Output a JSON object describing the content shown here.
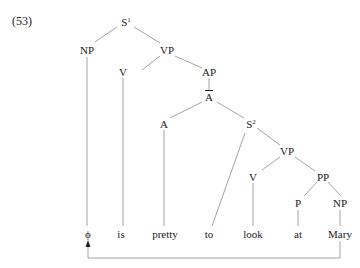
{
  "example_number": "(53)",
  "nodes": {
    "s1": {
      "label": "S",
      "sup": "1"
    },
    "np_subj": {
      "label": "NP"
    },
    "vp_main": {
      "label": "VP"
    },
    "v_is": {
      "label": "V"
    },
    "ap": {
      "label": "AP"
    },
    "abar": {
      "label": "A"
    },
    "a": {
      "label": "A"
    },
    "s2": {
      "label": "S",
      "sup": "2"
    },
    "vp_inf": {
      "label": "VP"
    },
    "v_look": {
      "label": "V"
    },
    "pp": {
      "label": "PP"
    },
    "p": {
      "label": "P"
    },
    "np_obj": {
      "label": "NP"
    }
  },
  "terminals": [
    "ϕ",
    "is",
    "pretty",
    "to",
    "look",
    "at",
    "Mary"
  ],
  "line_color": "#999999",
  "arrow": {
    "from": "Mary",
    "to": "ϕ"
  }
}
